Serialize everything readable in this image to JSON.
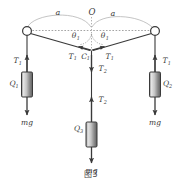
{
  "figure": {
    "caption": "图3",
    "points": {
      "origin_label": "O",
      "junction_label": "C",
      "junction_sub": "1"
    },
    "dimensions": [
      {
        "id": "left-span",
        "label": "a"
      },
      {
        "id": "right-span",
        "label": "a"
      }
    ],
    "angles": [
      {
        "id": "left-angle",
        "symbol": "θ",
        "sub": "1"
      },
      {
        "id": "right-angle",
        "symbol": "θ",
        "sub": "1"
      }
    ],
    "tensions": {
      "left_hanger": {
        "symbol": "T",
        "sub": "1"
      },
      "right_hanger": {
        "symbol": "T",
        "sub": "1"
      },
      "left_junction": {
        "symbol": "T",
        "sub": "1"
      },
      "right_junction": {
        "symbol": "T",
        "sub": "1"
      },
      "center_upper": {
        "symbol": "T",
        "sub": "2"
      },
      "center_lower": {
        "symbol": "T",
        "sub": "2"
      }
    },
    "weights": [
      {
        "id": "left-weight",
        "symbol": "Q",
        "sub": "1",
        "force": "mg"
      },
      {
        "id": "right-weight",
        "symbol": "Q",
        "sub": "2",
        "force": "mg"
      },
      {
        "id": "center-weight",
        "symbol": "Q",
        "sub": "3",
        "force": "mg"
      }
    ],
    "colors": {
      "stroke": "#3a3a3a",
      "dashed": "#9a9a9a",
      "block_light": "#e9e9e9",
      "block_mid": "#b9b9b9",
      "block_dark": "#6e6e6e",
      "text": "#3a3a3a",
      "background": "#ffffff"
    }
  }
}
